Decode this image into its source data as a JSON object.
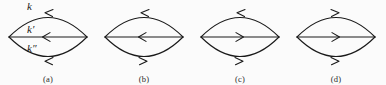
{
  "figure": {
    "background_color": "#fbfbfb",
    "ink_color": "#1a1a1a",
    "width": 386,
    "height": 85
  },
  "momentum_labels": {
    "upper": "k",
    "middle": "k′",
    "lower": "k″"
  },
  "diagrams": [
    {
      "id": "a",
      "caption": "(a)",
      "x": 0,
      "labeled": true,
      "lines": [
        {
          "name": "upper-arc",
          "direction": "left",
          "momentum": "k"
        },
        {
          "name": "middle-line",
          "direction": "left",
          "momentum": "k′"
        },
        {
          "name": "lower-arc",
          "direction": "left",
          "momentum": "k″"
        }
      ]
    },
    {
      "id": "b",
      "caption": "(b)",
      "x": 96,
      "labeled": false,
      "lines": [
        {
          "name": "upper-arc",
          "direction": "left",
          "momentum": ""
        },
        {
          "name": "middle-line",
          "direction": "left",
          "momentum": ""
        },
        {
          "name": "lower-arc",
          "direction": "right",
          "momentum": ""
        }
      ]
    },
    {
      "id": "c",
      "caption": "(c)",
      "x": 192,
      "labeled": false,
      "lines": [
        {
          "name": "upper-arc",
          "direction": "left",
          "momentum": ""
        },
        {
          "name": "middle-line",
          "direction": "right",
          "momentum": ""
        },
        {
          "name": "lower-arc",
          "direction": "right",
          "momentum": ""
        }
      ]
    },
    {
      "id": "d",
      "caption": "(d)",
      "x": 288,
      "labeled": false,
      "lines": [
        {
          "name": "upper-arc",
          "direction": "right",
          "momentum": ""
        },
        {
          "name": "middle-line",
          "direction": "right",
          "momentum": ""
        },
        {
          "name": "lower-arc",
          "direction": "right",
          "momentum": ""
        }
      ]
    }
  ]
}
